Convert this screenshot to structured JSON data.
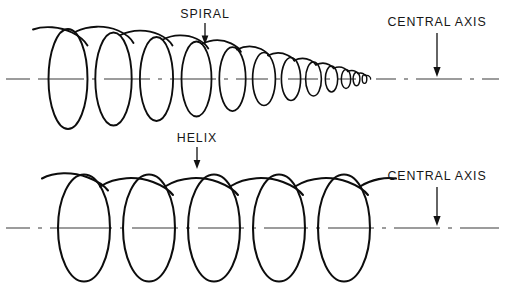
{
  "figure": {
    "background_color": "#ffffff",
    "ink_color": "#0d0d0d",
    "axis_color": "#3b3b3b",
    "width": 505,
    "height": 302
  },
  "chart_data": {
    "type": "diagram",
    "panels": [
      {
        "id": "spiral-panel",
        "name": "SPIRAL",
        "description": "Coil of continuously decreasing diameter wound about a straight central axis, tapering left to right",
        "axis_y": 79,
        "axis_x_start": 6,
        "axis_x_end": 499,
        "coil_count": 12,
        "coils": [
          {
            "index": 1,
            "cx": 68,
            "rx": 19.5,
            "ry": 50.0
          },
          {
            "index": 2,
            "cx": 113.5,
            "rx": 18.2,
            "ry": 46.5
          },
          {
            "index": 3,
            "cx": 156.5,
            "rx": 16.6,
            "ry": 42.0
          },
          {
            "index": 4,
            "cx": 196.5,
            "rx": 15.0,
            "ry": 37.5
          },
          {
            "index": 5,
            "cx": 232.5,
            "rx": 13.2,
            "ry": 32.0
          },
          {
            "index": 6,
            "cx": 264.0,
            "rx": 11.4,
            "ry": 26.5
          },
          {
            "index": 7,
            "cx": 291.0,
            "rx": 9.6,
            "ry": 21.5
          },
          {
            "index": 8,
            "cx": 313.5,
            "rx": 7.9,
            "ry": 17.0
          },
          {
            "index": 9,
            "cx": 331.5,
            "rx": 6.2,
            "ry": 13.0
          },
          {
            "index": 10,
            "cx": 346.0,
            "rx": 4.7,
            "ry": 9.6
          },
          {
            "index": 11,
            "cx": 356.5,
            "rx": 3.4,
            "ry": 6.8
          },
          {
            "index": 12,
            "cx": 364.5,
            "rx": 2.3,
            "ry": 4.4
          }
        ]
      },
      {
        "id": "helix-panel",
        "name": "HELIX",
        "description": "Coil of constant diameter wound about a straight central axis, uniform pitch",
        "axis_y": 228,
        "axis_x_start": 6,
        "axis_x_end": 499,
        "coil_count": 5,
        "coils": [
          {
            "index": 1,
            "cx": 84,
            "rx": 26,
            "ry": 53.5
          },
          {
            "index": 2,
            "cx": 149,
            "rx": 26,
            "ry": 53.5
          },
          {
            "index": 3,
            "cx": 214,
            "rx": 26,
            "ry": 53.5
          },
          {
            "index": 4,
            "cx": 279,
            "rx": 26,
            "ry": 53.5
          },
          {
            "index": 5,
            "cx": 344,
            "rx": 26,
            "ry": 53.5
          }
        ]
      }
    ]
  },
  "labels": {
    "spiral": {
      "text": "SPIRAL",
      "x": 205,
      "y": 18,
      "arrow_x": 205,
      "arrow_from_y": 23,
      "arrow_to_y": 43
    },
    "helix": {
      "text": "HELIX",
      "x": 197,
      "y": 142,
      "arrow_x": 197,
      "arrow_from_y": 147,
      "arrow_to_y": 168
    },
    "central_axis_top": {
      "text": "CENTRAL AXIS",
      "x": 437,
      "y": 26,
      "arrow_x": 437,
      "arrow_from_y": 33,
      "arrow_to_y": 76
    },
    "central_axis_bottom": {
      "text": "CENTRAL AXIS",
      "x": 437,
      "y": 180,
      "arrow_x": 437,
      "arrow_from_y": 187,
      "arrow_to_y": 225
    }
  }
}
